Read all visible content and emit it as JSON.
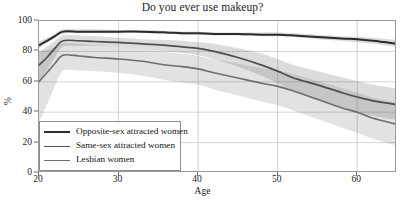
{
  "chart_data": {
    "type": "line",
    "title": "Do you ever use makeup?",
    "xlabel": "Age",
    "ylabel": "%",
    "xlim": [
      20,
      65
    ],
    "ylim": [
      0,
      100
    ],
    "grid": true,
    "legend_position": "lower left",
    "xticks": [
      20,
      30,
      40,
      50,
      60
    ],
    "yticks": [
      0,
      20,
      40,
      60,
      80,
      100
    ],
    "x": [
      20,
      21,
      22,
      23,
      25,
      27,
      30,
      33,
      36,
      38,
      40,
      42,
      45,
      48,
      50,
      52,
      55,
      58,
      60,
      62,
      65
    ],
    "series": [
      {
        "name": "Opposite-sex attracted women",
        "color": "#2b2b2b",
        "values": [
          84,
          87,
          90,
          93,
          93,
          93,
          93,
          93,
          92.5,
          92,
          92,
          91.5,
          91.5,
          91,
          91,
          90.5,
          89.5,
          88.5,
          88,
          87,
          85
        ],
        "band_lower": [
          82,
          85.5,
          88.5,
          91.5,
          92,
          92,
          92,
          92,
          91.5,
          91,
          91,
          90.5,
          90.5,
          90,
          90,
          89.5,
          88,
          87,
          86,
          85,
          83
        ],
        "band_upper": [
          86.5,
          89,
          91.5,
          94.5,
          94.5,
          94.5,
          94,
          94,
          93.5,
          93,
          93,
          92.5,
          92.5,
          92.5,
          92.5,
          92,
          91,
          90,
          89.5,
          89,
          87.5
        ]
      },
      {
        "name": "Same-sex attracted women",
        "color": "#4e4e4e",
        "values": [
          71,
          76,
          82,
          87,
          87,
          86.5,
          86,
          85,
          84,
          83,
          82,
          80,
          76,
          71,
          67,
          62.5,
          58,
          53,
          50,
          47.5,
          45
        ],
        "band_lower": [
          60,
          68,
          76,
          83,
          83.5,
          83.5,
          83,
          81.5,
          80,
          79,
          77.5,
          75,
          70,
          64,
          59,
          54,
          48,
          43,
          40,
          37.5,
          35
        ],
        "band_upper": [
          80,
          83,
          87,
          90.5,
          90.5,
          90,
          89,
          88,
          87.5,
          87,
          86,
          85,
          82,
          78.5,
          75,
          71,
          67,
          63,
          60.5,
          58,
          55.5
        ]
      },
      {
        "name": "Lesbian women",
        "color": "#6e6e6e",
        "values": [
          60,
          66,
          72,
          77.5,
          77,
          76,
          75,
          73.5,
          71,
          70,
          68.5,
          66,
          62.5,
          59,
          57,
          54,
          48.5,
          43,
          40,
          36,
          32
        ],
        "band_lower": [
          33,
          45,
          57,
          67,
          67.5,
          67,
          66,
          64,
          61,
          59.5,
          58,
          55,
          51,
          47,
          44.5,
          41,
          35.5,
          30,
          26.5,
          22.5,
          18
        ],
        "band_upper": [
          80,
          81,
          83,
          85.5,
          85,
          84,
          83,
          81.5,
          79.5,
          78.5,
          77,
          75,
          72,
          69,
          67.5,
          65,
          60.5,
          56,
          53,
          49.5,
          46
        ]
      }
    ]
  },
  "legend": {
    "items": [
      {
        "label": "Opposite-sex attracted women"
      },
      {
        "label": "Same-sex attracted women"
      },
      {
        "label": "Lesbian women"
      }
    ]
  },
  "axes": {
    "ytick_labels": [
      "0",
      "20",
      "40",
      "60",
      "80",
      "100"
    ],
    "xtick_labels": [
      "20",
      "30",
      "40",
      "50",
      "60"
    ]
  },
  "colors": {
    "grid": "#c8c8cf",
    "axis": "#9a9a9a",
    "text": "#1c1c1c"
  }
}
